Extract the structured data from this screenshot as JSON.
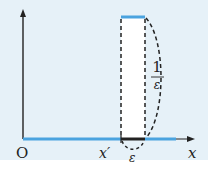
{
  "diagram": {
    "type": "step-function-pulse",
    "labels": {
      "origin": "O",
      "x_axis": "x",
      "pulse_start": "x′",
      "width": "ε",
      "height_numerator": "1",
      "height_denominator": "ε"
    },
    "colors": {
      "background": "#e6f1f8",
      "function_line": "#4aa3df",
      "axis": "#222222",
      "pulse_fill": "#ffffff",
      "dashed": "#222222"
    }
  }
}
